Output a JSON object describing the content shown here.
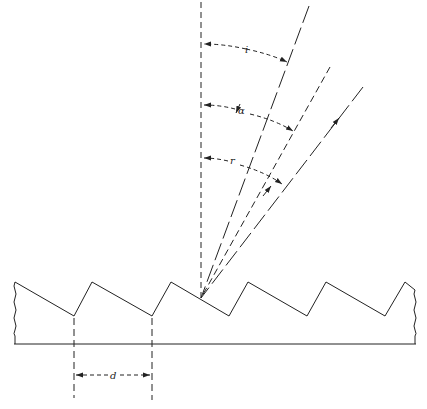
{
  "diagram": {
    "type": "blazed diffraction grating",
    "labels": {
      "incidence_angle": "i",
      "blaze_angle": "α",
      "reflection_angle": "r",
      "groove_spacing": "d"
    },
    "line_color": "#222222",
    "background": "#ffffff"
  }
}
